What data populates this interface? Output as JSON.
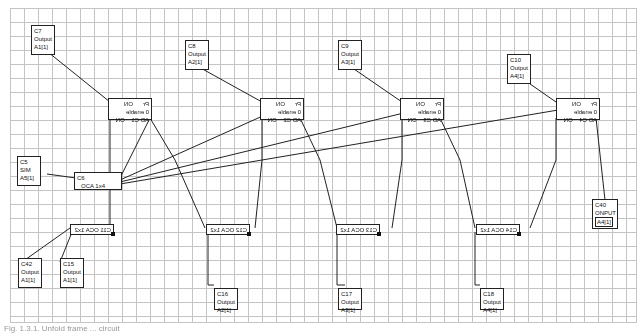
{
  "diagram": {
    "type": "function-block-network",
    "output_blocks": [
      {
        "id": "C7",
        "type": "Output",
        "addr": "A1[1]"
      },
      {
        "id": "C8",
        "type": "Output",
        "addr": "A2[1]"
      },
      {
        "id": "C9",
        "type": "Output",
        "addr": "A3[1]"
      },
      {
        "id": "C10",
        "type": "Output",
        "addr": "A4[1]"
      }
    ],
    "ctrl_blocks": [
      {
        "id": "C1",
        "top_left": "ON",
        "top_right": "Pr",
        "mid": "0 enable",
        "bot_left": "ON",
        "bot_right": "AD C1"
      },
      {
        "id": "C2",
        "top_left": "ON",
        "top_right": "Pr",
        "mid": "0 enable",
        "bot_left": "ON",
        "bot_right": "AD C2"
      },
      {
        "id": "C3",
        "top_left": "ON",
        "top_right": "Pr",
        "mid": "0 enable",
        "bot_left": "ON",
        "bot_right": "AD C3"
      },
      {
        "id": "C4",
        "top_left": "ON",
        "top_right": "Pr",
        "mid": "0 enable",
        "bot_left": "ON",
        "bot_right": "AD C4"
      }
    ],
    "sim_block": {
      "id": "C5",
      "type": "SIM",
      "addr": "A5[1]"
    },
    "oca_block": {
      "id": "C6",
      "label": "OCA 1x4"
    },
    "split_blocks": [
      {
        "id": "C11",
        "label": "C11 OCA 1x2"
      },
      {
        "id": "C12",
        "label": "C12 OCA 1x2"
      },
      {
        "id": "C13",
        "label": "C13 OCA 1x2"
      },
      {
        "id": "C14",
        "label": "C14 OCA 1x2"
      }
    ],
    "bottom_outputs": [
      {
        "id": "C42",
        "type": "Output",
        "addr": "A1[1]"
      },
      {
        "id": "C15",
        "type": "Output",
        "addr": "A1[1]"
      },
      {
        "id": "C16",
        "type": "Output",
        "addr": "A2[1]"
      },
      {
        "id": "C17",
        "type": "Output",
        "addr": "A3[1]"
      },
      {
        "id": "C18",
        "type": "Output",
        "addr": "A4[1]"
      }
    ],
    "input_block": {
      "id": "C40",
      "type": "ONPUT",
      "addr": "A4[1]"
    }
  },
  "caption": "Fig. 1.3.1. Unfold frame ... circuit"
}
